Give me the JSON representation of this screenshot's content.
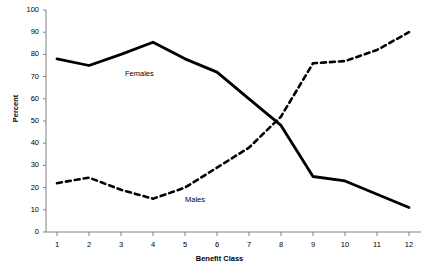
{
  "chart_data": {
    "type": "line",
    "title": "",
    "subtitle": "",
    "xlabel": "Benefit Class",
    "ylabel": "Percent",
    "categories": [
      1,
      2,
      3,
      4,
      5,
      6,
      7,
      8,
      9,
      10,
      11,
      12
    ],
    "x_tick_labels": [
      "1",
      "2",
      "3",
      "4",
      "5",
      "6",
      "7",
      "8",
      "9",
      "10",
      "11",
      "12"
    ],
    "y_tick_labels": [
      "0",
      "10",
      "20",
      "30",
      "40",
      "50",
      "60",
      "70",
      "80",
      "90",
      "100"
    ],
    "y_ticks": [
      0,
      10,
      20,
      30,
      40,
      50,
      60,
      70,
      80,
      90,
      100
    ],
    "ylim": [
      0,
      100
    ],
    "xlim": [
      1,
      12
    ],
    "grid": false,
    "legend_position": "inline-annotation",
    "series": [
      {
        "name": "Females",
        "style": "solid",
        "color": "#000000",
        "values": [
          78,
          75,
          80,
          85.5,
          78,
          72,
          60,
          48,
          25,
          23,
          17,
          11
        ]
      },
      {
        "name": "Males",
        "style": "dashed",
        "color": "#000000",
        "values": [
          22,
          24.5,
          19,
          15,
          20,
          29,
          38,
          52,
          76,
          77,
          82,
          90
        ]
      }
    ],
    "annotations": [
      {
        "text": "Females",
        "x": 4.8,
        "y": 70
      },
      {
        "text": "Males",
        "x": 6.6,
        "y": 18
      }
    ]
  },
  "axes": {
    "axis_color": "#808080",
    "background": "#ffffff"
  }
}
